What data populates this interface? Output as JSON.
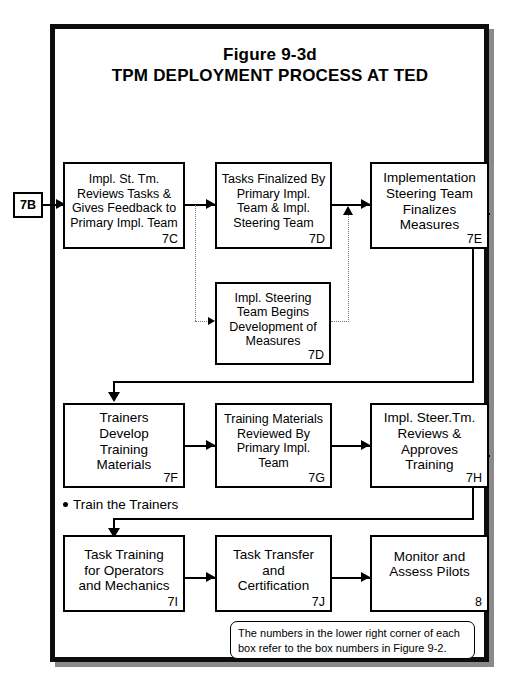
{
  "figure": {
    "title_line1": "Figure 9-3d",
    "title_line2": "TPM DEPLOYMENT PROCESS AT TED"
  },
  "entry_tag": {
    "label": "7B"
  },
  "boxes": [
    {
      "id": "box-7c",
      "text": "Impl. St. Tm.\nReviews Tasks &\nGives Feedback to\nPrimary Impl. Team",
      "code": "7C"
    },
    {
      "id": "box-7d-tasks",
      "text": "Tasks Finalized By\nPrimary Impl.\nTeam  & Impl.\nSteering Team",
      "code": "7D"
    },
    {
      "id": "box-7e",
      "text": "Implementation\nSteering Team\nFinalizes\nMeasures",
      "code": "7E"
    },
    {
      "id": "box-7d-measures",
      "text": "Impl. Steering\nTeam Begins\nDevelopment of\nMeasures",
      "code": "7D"
    },
    {
      "id": "box-7f",
      "text": "Trainers\nDevelop\nTraining\nMaterials",
      "code": "7F"
    },
    {
      "id": "box-7g",
      "text": "Training Materials\nReviewed By\nPrimary Impl.\nTeam",
      "code": "7G"
    },
    {
      "id": "box-7h",
      "text": "Impl. Steer.Tm.\nReviews &\nApproves\nTraining",
      "code": "7H"
    },
    {
      "id": "box-7i",
      "text": "Task Training\nfor  Operators\nand Mechanics",
      "code": "7I"
    },
    {
      "id": "box-7j",
      "text": "Task Transfer\nand\nCertification",
      "code": "7J"
    },
    {
      "id": "box-8",
      "text": "Monitor and\nAssess Pilots",
      "code": "8"
    }
  ],
  "bullet_note": {
    "label": "Train the Trainers"
  },
  "footnote": {
    "text": "The numbers in the lower right corner of each box refer to the box numbers in Figure 9-2."
  },
  "colors": {
    "frame": "#0d0d0d",
    "box_border": "#000000",
    "connector": "#000000",
    "dotted_connector": "#777777",
    "background": "#ffffff"
  }
}
